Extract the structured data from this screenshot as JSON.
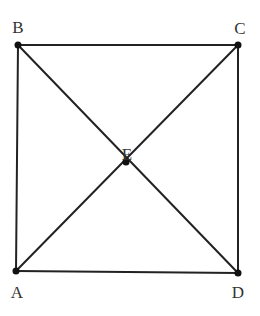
{
  "diagram": {
    "type": "square-with-diagonals",
    "points": [
      {
        "id": "A",
        "label": "A",
        "x": 16,
        "y": 271,
        "lx": 17,
        "ly": 298
      },
      {
        "id": "B",
        "label": "B",
        "x": 18,
        "y": 45,
        "lx": 18,
        "ly": 33
      },
      {
        "id": "C",
        "label": "C",
        "x": 238,
        "y": 45,
        "lx": 240,
        "ly": 34
      },
      {
        "id": "D",
        "label": "D",
        "x": 238,
        "y": 273,
        "lx": 238,
        "ly": 298
      },
      {
        "id": "E",
        "label": "E",
        "x": 126,
        "y": 162,
        "lx": 127,
        "ly": 160
      }
    ],
    "segments": [
      {
        "from": "B",
        "to": "C"
      },
      {
        "from": "C",
        "to": "D"
      },
      {
        "from": "D",
        "to": "A"
      },
      {
        "from": "A",
        "to": "B"
      },
      {
        "from": "B",
        "to": "D"
      },
      {
        "from": "A",
        "to": "C"
      }
    ],
    "colors": {
      "line": "#222222",
      "point": "#111111",
      "label": "#333333",
      "background": "#ffffff"
    }
  }
}
